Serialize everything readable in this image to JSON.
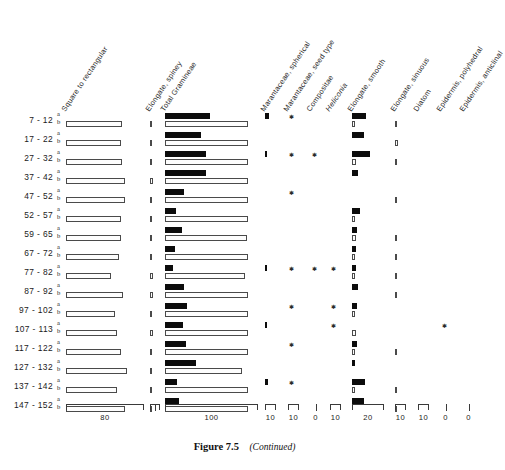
{
  "caption": {
    "label": "Figure 7.5",
    "note": "(Continued)"
  },
  "chart_data": {
    "type": "bar",
    "subtype": "stratigraphic-pollen-diagram",
    "xlabel": "",
    "ylabel": "Depth (cm)",
    "grid": false,
    "legend": "none",
    "categories": [
      "7 - 12",
      "17 - 22",
      "27 - 32",
      "37 - 42",
      "47 - 52",
      "52 - 57",
      "59 - 65",
      "67 - 72",
      "77 - 82",
      "87 - 92",
      "97 - 102",
      "107 - 113",
      "117 - 122",
      "127 - 132",
      "137 - 142",
      "147 - 152"
    ],
    "subrows": [
      "a",
      "b"
    ],
    "columns": [
      {
        "name": "Square to rectangular",
        "italic": false,
        "scale_max": 100,
        "axis_label": "80"
      },
      {
        "name": "Elongate, spiney",
        "italic": false,
        "scale_max": 12,
        "axis_label": ""
      },
      {
        "name": "Total Gramineae",
        "italic": false,
        "scale_max": 110,
        "axis_label": "100"
      },
      {
        "name": "Marantaceae, spherical",
        "italic": false,
        "scale_max": 12,
        "axis_label": "10"
      },
      {
        "name": "Marantaceae, seed type",
        "italic": false,
        "scale_max": 12,
        "axis_label": "10"
      },
      {
        "name": "Compositae",
        "italic": false,
        "scale_max": 5,
        "axis_label": "0"
      },
      {
        "name": "Heliconia",
        "italic": true,
        "scale_max": 12,
        "axis_label": "10"
      },
      {
        "name": "Elongate, smooth",
        "italic": false,
        "scale_max": 25,
        "axis_label": "20"
      },
      {
        "name": "Elongate, sinuous",
        "italic": false,
        "scale_max": 12,
        "axis_label": "10"
      },
      {
        "name": "Diatom",
        "italic": false,
        "scale_max": 12,
        "axis_label": "10"
      },
      {
        "name": "Epidermis, polyhedral",
        "italic": false,
        "scale_max": 5,
        "axis_label": "0"
      },
      {
        "name": "Epidermis, anticlinal",
        "italic": false,
        "scale_max": 5,
        "axis_label": "0"
      }
    ],
    "axis_ticks": [
      "80",
      "",
      "100",
      "10",
      "10",
      "0",
      "10",
      "20",
      "10",
      "10",
      "0",
      "0"
    ],
    "series": [
      {
        "name": "Square to rectangular",
        "a": [
          0,
          0,
          0,
          0,
          0,
          0,
          0,
          0,
          0,
          0,
          0,
          0,
          0,
          0,
          0,
          0
        ],
        "b": [
          72,
          71,
          72,
          75,
          75,
          70,
          71,
          68,
          58,
          73,
          63,
          66,
          70,
          78,
          66,
          76
        ]
      },
      {
        "name": "Elongate, spiney",
        "a": [
          0,
          0,
          0,
          0,
          0,
          0,
          0,
          0,
          0,
          0,
          0,
          0,
          0,
          0,
          0,
          0
        ],
        "b": [
          2,
          2,
          2,
          3,
          2,
          2,
          2,
          2,
          3,
          3,
          2,
          3,
          2,
          2,
          2,
          2
        ]
      },
      {
        "name": "Total Gramineae",
        "a": [
          53,
          43,
          48,
          49,
          22,
          13,
          20,
          12,
          9,
          22,
          26,
          21,
          25,
          37,
          14,
          17
        ],
        "b": [
          98,
          98,
          98,
          98,
          98,
          98,
          97,
          98,
          95,
          98,
          98,
          98,
          98,
          91,
          98,
          98
        ]
      },
      {
        "name": "Marantaceae, spherical",
        "a": [
          4,
          0,
          2,
          0,
          0,
          0,
          0,
          0,
          2,
          0,
          0,
          2,
          0,
          0,
          3,
          0
        ],
        "b": [
          0,
          0,
          0,
          0,
          0,
          0,
          0,
          0,
          0,
          0,
          0,
          0,
          0,
          0,
          0,
          0
        ]
      },
      {
        "name": "Marantaceae, seed type",
        "a": [
          "*",
          0,
          "*",
          0,
          "*",
          0,
          0,
          0,
          "*",
          0,
          "*",
          0,
          "*",
          0,
          "*",
          0
        ],
        "b": [
          0,
          0,
          0,
          0,
          0,
          0,
          0,
          0,
          0,
          0,
          0,
          0,
          0,
          0,
          0,
          0
        ]
      },
      {
        "name": "Compositae",
        "a": [
          0,
          0,
          "*",
          0,
          0,
          0,
          0,
          0,
          "*",
          0,
          0,
          0,
          0,
          0,
          0,
          0
        ],
        "b": [
          0,
          0,
          0,
          0,
          0,
          0,
          0,
          0,
          0,
          0,
          0,
          0,
          0,
          0,
          0,
          0
        ]
      },
      {
        "name": "Heliconia",
        "a": [
          0,
          0,
          0,
          0,
          0,
          0,
          0,
          0,
          "*",
          0,
          "*",
          "*",
          0,
          0,
          0,
          0
        ],
        "b": [
          0,
          0,
          0,
          0,
          0,
          0,
          0,
          0,
          0,
          0,
          0,
          0,
          0,
          0,
          0,
          0
        ]
      },
      {
        "name": "Elongate, smooth",
        "a": [
          11,
          9,
          14,
          5,
          0,
          6,
          4,
          3,
          3,
          5,
          4,
          0,
          4,
          2,
          10,
          9
        ],
        "b": [
          2,
          0,
          3,
          0,
          0,
          2,
          3,
          2,
          2,
          0,
          2,
          3,
          2,
          0,
          2,
          0
        ]
      },
      {
        "name": "Elongate, sinuous",
        "a": [
          0,
          0,
          0,
          0,
          0,
          0,
          0,
          0,
          0,
          0,
          0,
          0,
          0,
          0,
          0,
          0
        ],
        "b": [
          2,
          3,
          2,
          0,
          2,
          0,
          2,
          2,
          2,
          2,
          0,
          0,
          2,
          0,
          2,
          2
        ]
      },
      {
        "name": "Diatom",
        "a": [
          0,
          0,
          0,
          0,
          0,
          0,
          0,
          0,
          0,
          0,
          0,
          0,
          0,
          0,
          0,
          0
        ],
        "b": [
          0,
          0,
          0,
          0,
          0,
          0,
          0,
          0,
          0,
          0,
          0,
          0,
          0,
          0,
          0,
          0
        ]
      },
      {
        "name": "Epidermis, polyhedral",
        "a": [
          0,
          0,
          0,
          0,
          0,
          0,
          0,
          0,
          0,
          0,
          0,
          "*",
          0,
          0,
          0,
          0
        ],
        "b": [
          0,
          0,
          0,
          0,
          0,
          0,
          0,
          0,
          0,
          0,
          0,
          0,
          0,
          0,
          0,
          0
        ]
      },
      {
        "name": "Epidermis, anticlinal",
        "a": [
          0,
          0,
          0,
          0,
          0,
          0,
          0,
          0,
          0,
          0,
          0,
          0,
          0,
          0,
          0,
          0
        ],
        "b": [
          0,
          0,
          0,
          0,
          0,
          0,
          0,
          0,
          0,
          0,
          0,
          0,
          0,
          0,
          0,
          0
        ]
      }
    ]
  }
}
